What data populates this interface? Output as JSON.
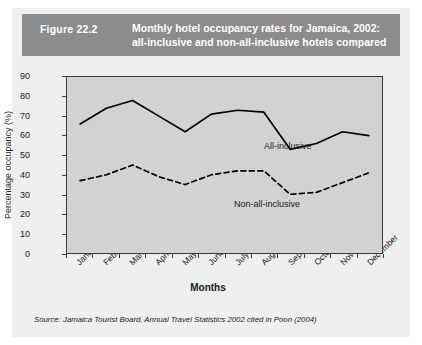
{
  "figure": {
    "number": "Figure 22.2",
    "title_line1": "Monthly hotel occupancy rates for Jamaica, 2002:",
    "title_line2": "all-inclusive and non-all-inclusive hotels compared",
    "header_bg": "#8c8c8c",
    "plot_bg": "#d2d2d2",
    "source": "Source: Jamaica Tourist Board, Annual Travel Statistics 2002 cited in Poon (2004)"
  },
  "annotations": {
    "all_inclusive": "All-inclusive",
    "non_all_inclusive": "Non-all-inclusive"
  },
  "chart_data": {
    "type": "line",
    "title": "Monthly hotel occupancy rates for Jamaica, 2002: all-inclusive and non-all-inclusive hotels compared",
    "xlabel": "Months",
    "ylabel": "Percentage occupancy (%)",
    "categories": [
      "January",
      "February",
      "March",
      "April",
      "May",
      "June",
      "July",
      "August",
      "September",
      "October",
      "November",
      "December"
    ],
    "ylim": [
      0,
      90
    ],
    "yticks": [
      0,
      10,
      20,
      30,
      40,
      50,
      60,
      70,
      80,
      90
    ],
    "grid": false,
    "legend_position": "inline-annotation",
    "series": [
      {
        "name": "All-inclusive",
        "style": "solid",
        "color": "#000000",
        "values": [
          66,
          74,
          78,
          70,
          62,
          71,
          73,
          72,
          53,
          56,
          62,
          60
        ]
      },
      {
        "name": "Non-all-inclusive",
        "style": "dashed",
        "color": "#000000",
        "values": [
          37,
          40,
          45,
          39,
          35,
          40,
          42,
          42,
          30,
          31,
          36,
          41
        ]
      }
    ]
  }
}
